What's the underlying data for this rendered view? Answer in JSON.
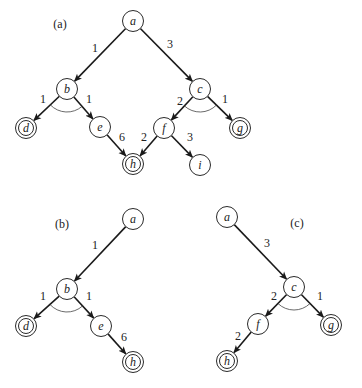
{
  "panels": [
    {
      "id": "a",
      "label": "(a)",
      "label_pos": [
        60,
        24
      ],
      "nodes": [
        {
          "id": "a",
          "label": "a",
          "x": 133,
          "y": 21,
          "goal": false
        },
        {
          "id": "b",
          "label": "b",
          "x": 67,
          "y": 89,
          "goal": false
        },
        {
          "id": "c",
          "label": "c",
          "x": 200,
          "y": 89,
          "goal": false
        },
        {
          "id": "d",
          "label": "d",
          "x": 26,
          "y": 128,
          "goal": true
        },
        {
          "id": "e",
          "label": "e",
          "x": 100,
          "y": 127,
          "goal": false
        },
        {
          "id": "f",
          "label": "f",
          "x": 164,
          "y": 128,
          "goal": false
        },
        {
          "id": "g",
          "label": "g",
          "x": 240,
          "y": 128,
          "goal": true
        },
        {
          "id": "h",
          "label": "h",
          "x": 133,
          "y": 164,
          "goal": true
        },
        {
          "id": "i",
          "label": "i",
          "x": 200,
          "y": 165,
          "goal": false
        }
      ],
      "edges": [
        {
          "from": "a",
          "to": "b",
          "weight": "1",
          "label_pos": [
            95,
            48
          ]
        },
        {
          "from": "a",
          "to": "c",
          "weight": "3",
          "label_pos": [
            170,
            44
          ]
        },
        {
          "from": "b",
          "to": "d",
          "weight": "1",
          "label_pos": [
            43,
            99
          ]
        },
        {
          "from": "b",
          "to": "e",
          "weight": "1",
          "label_pos": [
            89,
            99
          ]
        },
        {
          "from": "c",
          "to": "f",
          "weight": "2",
          "label_pos": [
            180,
            101
          ]
        },
        {
          "from": "c",
          "to": "g",
          "weight": "1",
          "label_pos": [
            225,
            99
          ]
        },
        {
          "from": "e",
          "to": "h",
          "weight": "6",
          "label_pos": [
            122,
            137
          ]
        },
        {
          "from": "f",
          "to": "h",
          "weight": "2",
          "label_pos": [
            144,
            137
          ]
        },
        {
          "from": "f",
          "to": "i",
          "weight": "3",
          "label_pos": [
            190,
            137
          ]
        }
      ],
      "and_arcs": [
        {
          "node": "b",
          "from": "d",
          "to": "e"
        },
        {
          "node": "c",
          "from": "f",
          "to": "g"
        }
      ]
    },
    {
      "id": "b",
      "label": "(b)",
      "label_pos": [
        62,
        224
      ],
      "nodes": [
        {
          "id": "a",
          "label": "a",
          "x": 133,
          "y": 219,
          "goal": false
        },
        {
          "id": "b",
          "label": "b",
          "x": 67,
          "y": 289,
          "goal": false
        },
        {
          "id": "d",
          "label": "d",
          "x": 26,
          "y": 326,
          "goal": true
        },
        {
          "id": "e",
          "label": "e",
          "x": 101,
          "y": 326,
          "goal": false
        },
        {
          "id": "h",
          "label": "h",
          "x": 133,
          "y": 362,
          "goal": true
        }
      ],
      "edges": [
        {
          "from": "a",
          "to": "b",
          "weight": "1",
          "label_pos": [
            95,
            245
          ]
        },
        {
          "from": "b",
          "to": "d",
          "weight": "1",
          "label_pos": [
            43,
            296
          ]
        },
        {
          "from": "b",
          "to": "e",
          "weight": "1",
          "label_pos": [
            89,
            296
          ]
        },
        {
          "from": "e",
          "to": "h",
          "weight": "6",
          "label_pos": [
            124,
            337
          ]
        }
      ],
      "and_arcs": [
        {
          "node": "b",
          "from": "d",
          "to": "e"
        }
      ]
    },
    {
      "id": "c",
      "label": "(c)",
      "label_pos": [
        297,
        223
      ],
      "nodes": [
        {
          "id": "a",
          "label": "a",
          "x": 227,
          "y": 217,
          "goal": false
        },
        {
          "id": "c",
          "label": "c",
          "x": 294,
          "y": 287,
          "goal": false
        },
        {
          "id": "f",
          "label": "f",
          "x": 258,
          "y": 324,
          "goal": false
        },
        {
          "id": "g",
          "label": "g",
          "x": 331,
          "y": 325,
          "goal": true
        },
        {
          "id": "h",
          "label": "h",
          "x": 227,
          "y": 361,
          "goal": true
        }
      ],
      "edges": [
        {
          "from": "a",
          "to": "c",
          "weight": "3",
          "label_pos": [
            267,
            243
          ]
        },
        {
          "from": "c",
          "to": "f",
          "weight": "2",
          "label_pos": [
            274,
            296
          ]
        },
        {
          "from": "c",
          "to": "g",
          "weight": "1",
          "label_pos": [
            320,
            296
          ]
        },
        {
          "from": "f",
          "to": "h",
          "weight": "2",
          "label_pos": [
            238,
            336
          ]
        }
      ],
      "and_arcs": [
        {
          "node": "c",
          "from": "f",
          "to": "g"
        }
      ]
    }
  ],
  "style": {
    "node_radius": 10.5,
    "goal_inner_radius": 7.5,
    "stroke_color": "#1a1a1a",
    "background": "#ffffff"
  }
}
